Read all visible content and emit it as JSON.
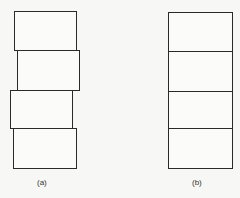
{
  "diagram": {
    "panel_a": {
      "label": "(a)",
      "description": "four rectangles stacked with horizontal offsets (misaligned)",
      "boxes": [
        {
          "x": 14,
          "y": 11,
          "w": 62,
          "h": 39
        },
        {
          "x": 17,
          "y": 50,
          "w": 62,
          "h": 40
        },
        {
          "x": 10,
          "y": 90,
          "w": 62,
          "h": 38
        },
        {
          "x": 13,
          "y": 128,
          "w": 63,
          "h": 40
        }
      ]
    },
    "panel_b": {
      "label": "(b)",
      "description": "four rectangles stacked in perfect vertical alignment",
      "boxes": [
        {
          "x": 168,
          "y": 12,
          "w": 64,
          "h": 39
        },
        {
          "x": 168,
          "y": 51,
          "w": 64,
          "h": 40
        },
        {
          "x": 168,
          "y": 91,
          "w": 64,
          "h": 37
        },
        {
          "x": 168,
          "y": 128,
          "w": 64,
          "h": 40
        }
      ]
    }
  }
}
